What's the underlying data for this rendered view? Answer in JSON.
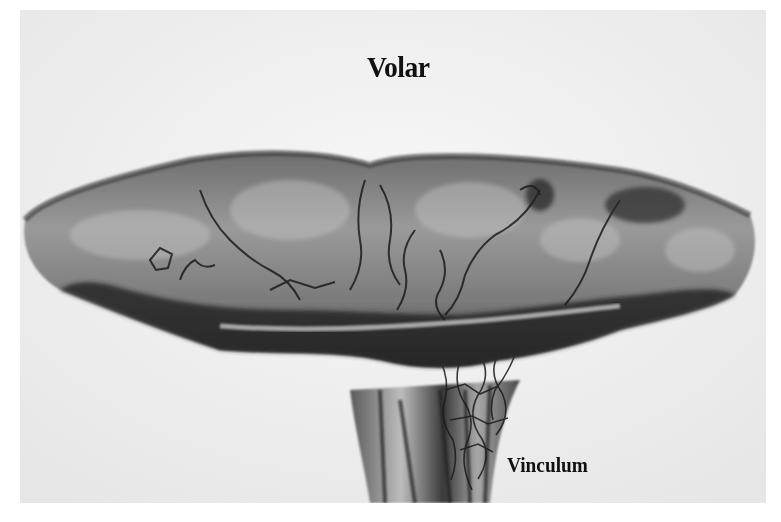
{
  "figure": {
    "colors": {
      "page_background": "#ffffff",
      "photo_background": "#f1f1f1",
      "tissue_light": "#8a8a8a",
      "tissue_dark": "#1e1e1e",
      "label_text": "#111111"
    },
    "labels": {
      "top": "Volar",
      "bottom_right": "Vinculum"
    }
  }
}
